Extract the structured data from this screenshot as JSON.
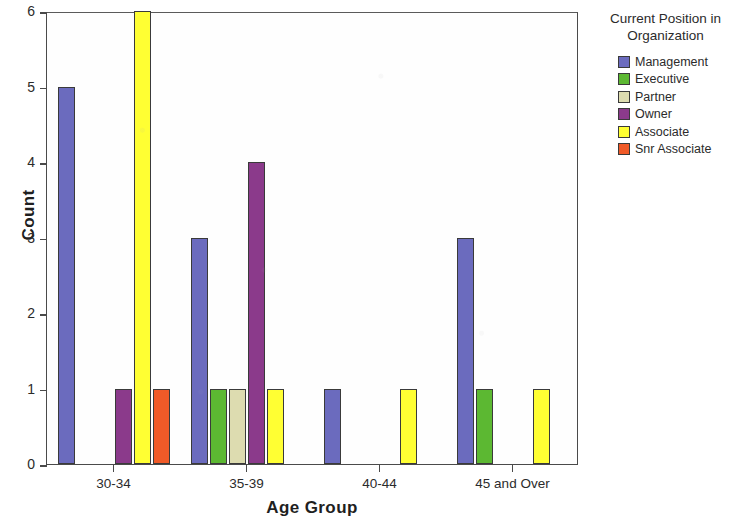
{
  "chart_data": {
    "type": "bar",
    "title": "",
    "subtitle": "",
    "xlabel": "Age Group",
    "ylabel": "Count",
    "categories": [
      "30-34",
      "35-39",
      "40-44",
      "45 and Over"
    ],
    "ylim": [
      0,
      6
    ],
    "ytick_labels": [
      "0",
      "1",
      "2",
      "3",
      "4",
      "5",
      "6"
    ],
    "ytick_values": [
      0,
      1,
      2,
      3,
      4,
      5,
      6
    ],
    "grid": false,
    "legend_position": "right",
    "legend_title": "Current Position in Organization",
    "series": [
      {
        "name": "Management",
        "color": "#6B6BBE",
        "values": [
          5,
          3,
          1,
          3
        ]
      },
      {
        "name": "Executive",
        "color": "#5CB832",
        "values": [
          0,
          1,
          0,
          1
        ]
      },
      {
        "name": "Partner",
        "color": "#DDDCB0",
        "values": [
          0,
          1,
          0,
          0
        ]
      },
      {
        "name": "Owner",
        "color": "#8B3A8B",
        "values": [
          1,
          4,
          0,
          0
        ]
      },
      {
        "name": "Associate",
        "color": "#FFFF33",
        "values": [
          6,
          1,
          1,
          1
        ]
      },
      {
        "name": "Snr Associate",
        "color": "#F05A28",
        "values": [
          1,
          0,
          0,
          0
        ]
      }
    ]
  },
  "legend": {
    "title_line_1": "Current Position in",
    "title_line_2": "Organization"
  }
}
